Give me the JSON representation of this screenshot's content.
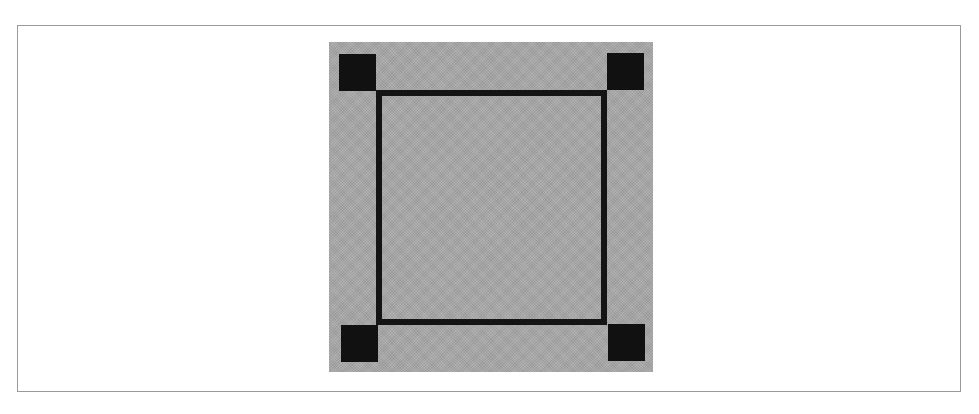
{
  "figure": {
    "colors": {
      "background": "#ffffff",
      "frame_border": "#9a9a9a",
      "panel": "#a8a8a8",
      "outline": "#141414",
      "handle": "#111111"
    },
    "panel": {
      "x": 329,
      "y": 42,
      "width": 324,
      "height": 330
    },
    "bounding_box": {
      "x": 376,
      "y": 90,
      "width": 231,
      "height": 235,
      "stroke": 6
    },
    "handles": [
      {
        "name": "top-left",
        "x": 339,
        "y": 54,
        "size": 37
      },
      {
        "name": "top-right",
        "x": 607,
        "y": 53,
        "size": 37
      },
      {
        "name": "bottom-left",
        "x": 341,
        "y": 325,
        "size": 37
      },
      {
        "name": "bottom-right",
        "x": 608,
        "y": 324,
        "size": 37
      }
    ]
  }
}
